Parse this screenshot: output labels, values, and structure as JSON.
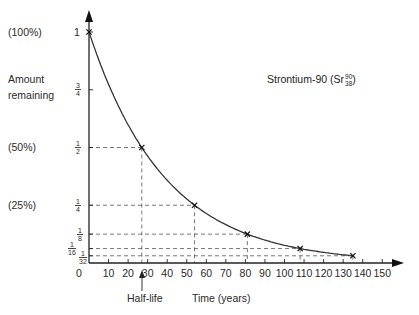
{
  "chart_data": {
    "type": "line",
    "series_label": "Strontium-90",
    "isotope": {
      "symbol": "Sr",
      "mass_number": "90",
      "atomic_number": "38"
    },
    "xlabel": "Time (years)",
    "ylabel": "Amount remaining",
    "xlim": [
      0,
      150
    ],
    "ylim": [
      0,
      1
    ],
    "x_ticks": [
      0,
      10,
      20,
      30,
      40,
      50,
      60,
      70,
      80,
      90,
      100,
      110,
      120,
      130,
      140,
      150
    ],
    "y_ticks": [
      {
        "value": 1,
        "label": "1",
        "percent_label": "(100%)"
      },
      {
        "value": 0.75,
        "label": "3/4",
        "percent_label": "Amount remaining"
      },
      {
        "value": 0.5,
        "label": "1/2",
        "percent_label": "(50%)"
      },
      {
        "value": 0.25,
        "label": "1/4",
        "percent_label": "(25%)"
      },
      {
        "value": 0.125,
        "label": "1/8",
        "percent_label": ""
      },
      {
        "value": 0.0625,
        "label": "1/16",
        "percent_label": ""
      },
      {
        "value": 0.03125,
        "label": "1/32",
        "percent_label": ""
      }
    ],
    "half_life_years": 27,
    "marked_points": [
      {
        "x": 0,
        "y": 1
      },
      {
        "x": 27,
        "y": 0.5
      },
      {
        "x": 54,
        "y": 0.25
      },
      {
        "x": 81,
        "y": 0.125
      },
      {
        "x": 108,
        "y": 0.0625
      },
      {
        "x": 135,
        "y": 0.03125
      }
    ],
    "annotations": [
      {
        "text": "Half-life",
        "x": 27,
        "arrow": true
      }
    ],
    "grid": false,
    "legend": "none"
  },
  "labels": {
    "pct100": "(100%)",
    "pct50": "(50%)",
    "pct25": "(25%)",
    "amount1": "Amount",
    "amount2": "remaining",
    "one": "1",
    "zero": "0",
    "frac_3_4_n": "3",
    "frac_3_4_d": "4",
    "frac_1_2_n": "1",
    "frac_1_2_d": "2",
    "frac_1_4_n": "1",
    "frac_1_4_d": "4",
    "frac_1_8_n": "1",
    "frac_1_8_d": "8",
    "frac_1_16_n": "1",
    "frac_1_16_d": "16",
    "frac_1_32_n": "1",
    "frac_1_32_d": "32",
    "title_main": "Strontium-90 (Sr",
    "title_mass": "90",
    "title_atomic": "38",
    "title_close": ")",
    "half_life": "Half-life",
    "xaxis": "Time (years)",
    "xt": [
      "10",
      "20",
      "30",
      "40",
      "50",
      "60",
      "70",
      "80",
      "90",
      "100",
      "110",
      "120",
      "130",
      "140",
      "150"
    ]
  }
}
